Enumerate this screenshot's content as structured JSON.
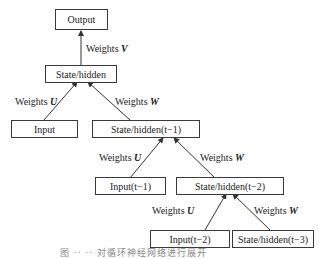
{
  "diagram": {
    "nodes": {
      "output": "Output",
      "state": "State/hidden",
      "input": "Input",
      "state_t1": "State/hidden(t−1)",
      "input_t1": "Input(t−1)",
      "state_t2": "State/hidden(t−2)",
      "input_t2": "Input(t−2)",
      "state_t3": "State/hidden(t−3)"
    },
    "edges": {
      "weights_prefix": "Weights",
      "v": "V",
      "u": "U",
      "w": "W"
    },
    "caption": "图 ·· ·· 对循环神经网络进行展开"
  }
}
